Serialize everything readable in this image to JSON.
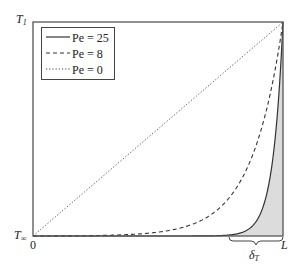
{
  "chart_data": {
    "type": "line",
    "title": "",
    "xlabel": "",
    "ylabel": "",
    "x_ticks": [
      "0",
      "L"
    ],
    "y_ticks": [
      "T∞",
      "T1"
    ],
    "xlim": [
      0,
      1
    ],
    "ylim": [
      0,
      1
    ],
    "grid": false,
    "legend_position": "upper left",
    "x": [
      0,
      0.1,
      0.2,
      0.3,
      0.4,
      0.5,
      0.6,
      0.7,
      0.8,
      0.85,
      0.9,
      0.95,
      1.0
    ],
    "series": [
      {
        "name": "Pe = 25",
        "style": "solid",
        "values": [
          0.0,
          0.0,
          0.0,
          0.0,
          0.0,
          0.0,
          0.0,
          0.0002,
          0.0067,
          0.0235,
          0.0821,
          0.2865,
          1.0
        ]
      },
      {
        "name": "Pe = 8",
        "style": "dashed",
        "values": [
          0.0,
          0.0004,
          0.0013,
          0.0033,
          0.0081,
          0.018,
          0.0405,
          0.0904,
          0.2016,
          0.3007,
          0.449,
          0.6703,
          1.0
        ]
      },
      {
        "name": "Pe = 0",
        "style": "dotted",
        "values": [
          0.0,
          0.1,
          0.2,
          0.3,
          0.4,
          0.5,
          0.6,
          0.7,
          0.8,
          0.85,
          0.9,
          0.95,
          1.0
        ]
      }
    ],
    "annotations": [
      {
        "text": "δT",
        "type": "brace",
        "x_range": [
          0.8,
          1.0
        ],
        "note": "thermal boundary layer; shaded region under Pe = 25 curve"
      }
    ]
  },
  "labels": {
    "y_top": "T",
    "y_top_sub": "1",
    "y_bottom": "T",
    "y_bottom_sub": "∞",
    "x_left": "0",
    "x_right": "L",
    "delta": "δ",
    "delta_sub": "T"
  },
  "legend": {
    "items": [
      {
        "label": "Pe = 25"
      },
      {
        "label": "Pe = 8"
      },
      {
        "label": "Pe = 0"
      }
    ]
  },
  "colors": {
    "axis": "#555555",
    "curve": "#333333",
    "shade": "#dcdcdc"
  }
}
